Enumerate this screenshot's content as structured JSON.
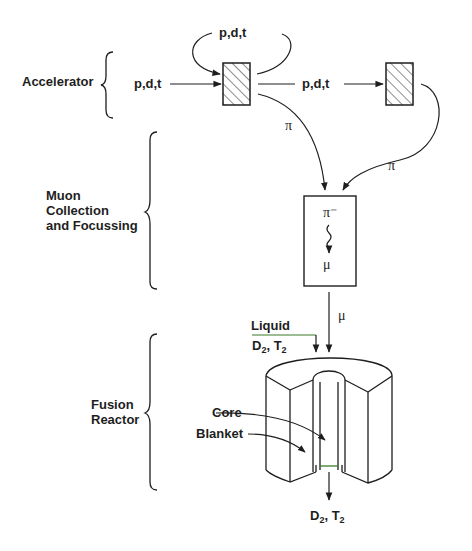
{
  "stages": {
    "accelerator": "Accelerator",
    "muon_line1": "Muon",
    "muon_line2": "Collection",
    "muon_line3": "and Focussing",
    "fusion_line1": "Fusion",
    "fusion_line2": "Reactor"
  },
  "beams": {
    "input": "p,d,t",
    "recirculated": "p,d,t",
    "forward": "p,d,t",
    "pion_1": "π",
    "pion_2": "π",
    "pion_minus": "π⁻",
    "muon_in_box": "μ",
    "muon_beam": "μ"
  },
  "reactor": {
    "liquid_label": "Liquid",
    "inlet_d2": "D",
    "inlet_sub1": "2",
    "inlet_t2": ", T",
    "inlet_sub2": "2",
    "core_label": "Core",
    "blanket_label": "Blanket",
    "outlet_d2": "D",
    "outlet_sub1": "2",
    "outlet_t2": ", T",
    "outlet_sub2": "2"
  },
  "colors": {
    "ink": "#1e1e1e",
    "liquid_line": "#3a7a2a"
  }
}
